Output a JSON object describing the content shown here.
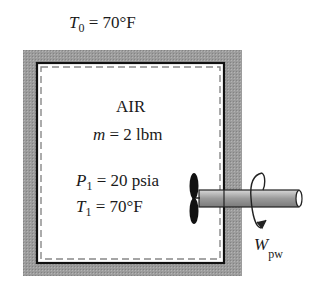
{
  "ambient": {
    "symbol": "T",
    "subscript": "0",
    "value": "= 70°F"
  },
  "system": {
    "name": "AIR",
    "mass": {
      "symbol": "m",
      "value": "= 2 lbm"
    },
    "pressure": {
      "symbol": "P",
      "subscript": "1",
      "value": "= 20 psia"
    },
    "temperature": {
      "symbol": "T",
      "subscript": "1",
      "value": "= 70°F"
    }
  },
  "work": {
    "symbol": "W",
    "subscript": "pw"
  },
  "colors": {
    "insulation": "#9a9a9a",
    "wall": "#111111",
    "shaft": "#a8a8a8",
    "propeller": "#111111"
  }
}
